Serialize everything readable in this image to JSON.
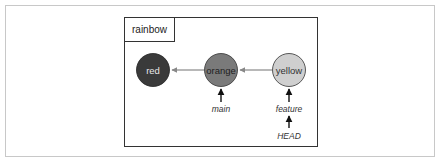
{
  "diagram": {
    "repository": {
      "label": "rainbow"
    },
    "commits": [
      {
        "id": "red",
        "label": "red",
        "fill": "#3a3a3a",
        "text_color": "#e8e8e8"
      },
      {
        "id": "orange",
        "label": "orange",
        "fill": "#7a7a7a",
        "text_color": "#1f1f1f"
      },
      {
        "id": "yellow",
        "label": "yellow",
        "fill": "#cfcfcf",
        "text_color": "#333333"
      }
    ],
    "edges": [
      {
        "from": "orange",
        "to": "red"
      },
      {
        "from": "yellow",
        "to": "orange"
      }
    ],
    "refs": [
      {
        "label": "main",
        "points_to": "orange"
      },
      {
        "label": "feature",
        "points_to": "yellow"
      },
      {
        "label": "HEAD",
        "points_to": "feature"
      }
    ]
  }
}
